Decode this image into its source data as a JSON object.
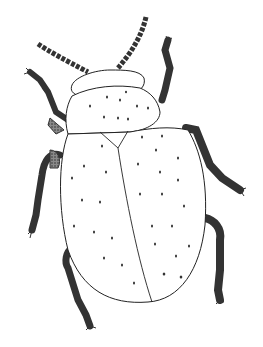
{
  "image": {
    "subject": "beetle line drawing",
    "description": "Pen-and-ink illustration of a beetle seen from above, with oval spotted elytra, a rounded pronotum, beaded antennae and six shaded segmented legs",
    "colors": {
      "background": "#ffffff",
      "ink": "#222222",
      "shade": "#555555",
      "body_fill": "#ffffff"
    },
    "parts": [
      "antenna-left",
      "antenna-right",
      "head",
      "pronotum",
      "elytron-left",
      "elytron-right",
      "scutellum",
      "leg-front-left",
      "leg-front-right",
      "leg-mid-left",
      "leg-mid-right",
      "leg-hind-left",
      "leg-hind-right"
    ]
  }
}
